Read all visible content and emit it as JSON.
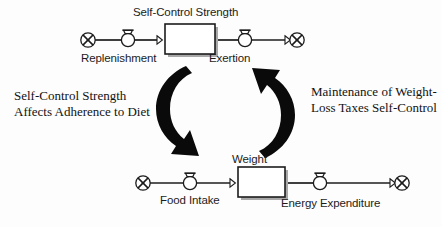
{
  "diagram": {
    "stock_flow_top": {
      "stock_label": "Self-Control Strength",
      "inflow_label": "Replenishment",
      "outflow_label": "Exertion",
      "source_icon": "cloud-icon",
      "sink_icon": "cloud-icon",
      "inflow_icon": "valve-icon",
      "outflow_icon": "valve-icon"
    },
    "stock_flow_bottom": {
      "stock_label": "Weight",
      "inflow_label": "Food Intake",
      "outflow_label": "Energy Expenditure",
      "source_icon": "cloud-icon",
      "sink_icon": "cloud-icon",
      "inflow_icon": "valve-icon",
      "outflow_icon": "valve-icon"
    },
    "annotations": {
      "left": "Self-Control Strength Affects Adherence to Diet",
      "right": "Maintenance of Weight-Loss Taxes Self-Control"
    },
    "loop_arrows": {
      "left_arrow_icon": "curved-arrow-down-icon",
      "right_arrow_icon": "curved-arrow-up-icon"
    },
    "colors": {
      "stroke": "#1c1c1c",
      "arrow_fill": "#0a0a0a",
      "background": "#fdfdfd",
      "stock_fill": "#ffffff",
      "shadow": "#9a9a9a"
    }
  }
}
